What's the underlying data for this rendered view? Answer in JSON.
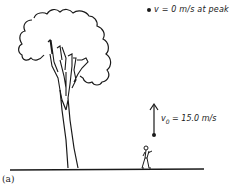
{
  "figure": {
    "part_label": "(a)",
    "peak_annotation": {
      "text": "v = 0 m/s at peak",
      "marker": "dot"
    },
    "launch_annotation": {
      "symbol": "v",
      "subscript": "0",
      "value_text": " = 15.0 m/s",
      "arrow_direction": "up"
    },
    "elements": [
      "tree",
      "person",
      "ground-line",
      "velocity-arrow",
      "ball-at-launch",
      "ball-at-peak"
    ],
    "colors": {
      "ink": "#1a1a1a",
      "background": "#ffffff"
    }
  }
}
